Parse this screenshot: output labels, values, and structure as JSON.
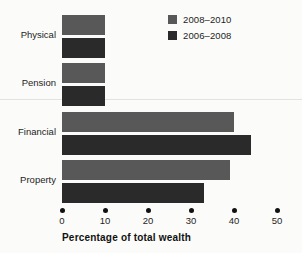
{
  "chart_data": {
    "type": "bar",
    "orientation": "horizontal",
    "title": "",
    "xlabel": "Percentage of total wealth",
    "ylabel": "",
    "xlim": [
      0,
      50
    ],
    "xticks": [
      0,
      10,
      20,
      30,
      40,
      50
    ],
    "grid": false,
    "legend_position": "top-right",
    "categories": [
      "Physical",
      "Pension",
      "Financial",
      "Property"
    ],
    "series": [
      {
        "name": "2008–2010",
        "color": "#585858",
        "values": [
          10,
          10,
          40,
          39
        ]
      },
      {
        "name": "2006–2008",
        "color": "#2a2a2a",
        "values": [
          10,
          10,
          44,
          33
        ]
      }
    ]
  },
  "legend": {
    "items": [
      {
        "label": "2008–2010",
        "color": "#585858"
      },
      {
        "label": "2006–2008",
        "color": "#2a2a2a"
      }
    ]
  },
  "axis": {
    "title": "Percentage of total wealth",
    "tick_labels": [
      "0",
      "10",
      "20",
      "30",
      "40",
      "50"
    ]
  },
  "categories": [
    "Physical",
    "Pension",
    "Financial",
    "Property"
  ]
}
